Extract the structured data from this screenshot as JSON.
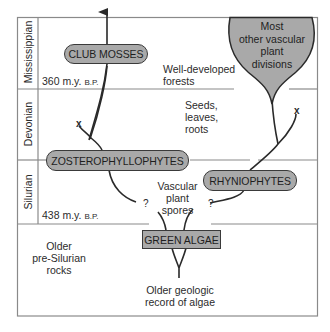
{
  "diagram": {
    "periods": [
      {
        "name": "Mississippian"
      },
      {
        "name": "Devonian"
      },
      {
        "name": "Silurian"
      }
    ],
    "time_markers": [
      {
        "value": "360 m.y.",
        "unit": "B.P."
      },
      {
        "value": "438 m.y.",
        "unit": "B.P."
      }
    ],
    "groups": {
      "club_mosses": "CLUB MOSSES",
      "zosterophyllophytes": "ZOSTEROPHYLLOPHYTES",
      "rhyniophytes": "RHYNIOPHYTES",
      "green_algae": "GREEN ALGAE",
      "other_divisions": [
        "Most",
        "other vascular",
        "plant",
        "divisions"
      ]
    },
    "annotations": {
      "forests": [
        "Well-developed",
        "forests"
      ],
      "seeds": [
        "Seeds,",
        "leaves,",
        "roots"
      ],
      "spores": [
        "Vascular",
        "plant",
        "spores"
      ],
      "pre_silurian": [
        "Older",
        "pre-Silurian",
        "rocks"
      ],
      "algae_record": [
        "Older geologic",
        "record of algae"
      ]
    },
    "markers": {
      "uncertain": "?",
      "extinct": "x"
    },
    "colors": {
      "fill": "#a9a9a9",
      "line": "#3a3a3a",
      "grid": "#8a8a8a",
      "background": "#ffffff"
    }
  }
}
